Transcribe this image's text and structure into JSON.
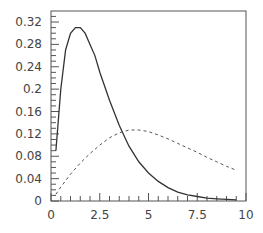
{
  "chart_data": {
    "type": "line",
    "title": "",
    "xlabel": "",
    "ylabel": "",
    "xlim": [
      0,
      10
    ],
    "ylim": [
      0,
      0.34
    ],
    "grid": false,
    "legend": null,
    "x_ticks": [
      "0",
      "2.5",
      "5",
      "7.5",
      "10"
    ],
    "y_ticks": [
      "0",
      "0.04",
      "0.08",
      "0.12",
      "0.16",
      "0.2",
      "0.24",
      "0.28",
      "0.32"
    ],
    "series": [
      {
        "name": "solid",
        "style": "solid",
        "color": "#333333",
        "x": [
          0.25,
          0.5,
          0.75,
          1.0,
          1.25,
          1.5,
          1.75,
          2.0,
          2.25,
          2.5,
          3.0,
          3.5,
          4.0,
          4.5,
          5.0,
          5.5,
          6.0,
          6.5,
          7.0,
          7.5,
          8.0,
          8.5,
          9.0,
          9.5
        ],
        "y": [
          0.09,
          0.2,
          0.27,
          0.3,
          0.31,
          0.31,
          0.3,
          0.28,
          0.26,
          0.23,
          0.18,
          0.135,
          0.098,
          0.07,
          0.05,
          0.035,
          0.024,
          0.016,
          0.011,
          0.008,
          0.005,
          0.004,
          0.003,
          0.002
        ]
      },
      {
        "name": "dashed",
        "style": "dashed",
        "color": "#555555",
        "x": [
          0.25,
          0.5,
          1.0,
          1.5,
          2.0,
          2.5,
          3.0,
          3.5,
          4.0,
          4.5,
          5.0,
          5.5,
          6.0,
          6.5,
          7.0,
          7.5,
          8.0,
          8.5,
          9.0,
          9.5
        ],
        "y": [
          0.012,
          0.025,
          0.048,
          0.068,
          0.085,
          0.1,
          0.113,
          0.122,
          0.127,
          0.127,
          0.124,
          0.118,
          0.111,
          0.103,
          0.095,
          0.087,
          0.078,
          0.07,
          0.062,
          0.055
        ]
      }
    ]
  }
}
